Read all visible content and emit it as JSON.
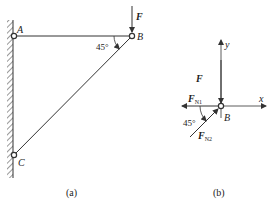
{
  "figure_a": {
    "caption": "(a)",
    "points": {
      "A": "A",
      "B": "B",
      "C": "C"
    },
    "force_label": "F",
    "angle_label": "45°"
  },
  "figure_b": {
    "caption": "(b)",
    "origin_label": "B",
    "x_axis_label": "x",
    "y_axis_label": "y",
    "forces": {
      "F": "F",
      "FN1_main": "F",
      "FN1_sub": "N1",
      "FN2_main": "F",
      "FN2_sub": "N2"
    },
    "angle_label": "45°"
  }
}
